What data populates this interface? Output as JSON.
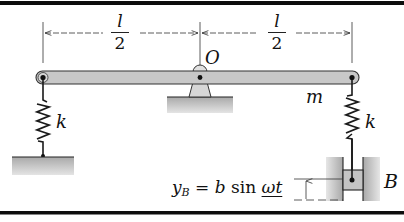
{
  "figure": {
    "labels": {
      "left_half_length": {
        "numerator": "l",
        "denominator": "2"
      },
      "right_half_length": {
        "numerator": "l",
        "denominator": "2"
      },
      "pivot": "O",
      "mass": "m",
      "left_spring": "k",
      "right_spring": "k",
      "support": "B"
    },
    "equation": {
      "lhs_var": "y",
      "lhs_sub": "B",
      "equals": " = ",
      "coef": "b",
      "func": " sin ",
      "arg": "ωt"
    },
    "colors": {
      "beam_fill": "#c8c8c8",
      "ground_fill": "#bdbdbd",
      "line": "#1a1a1a",
      "frame_rule": "#0d0d0d"
    }
  }
}
